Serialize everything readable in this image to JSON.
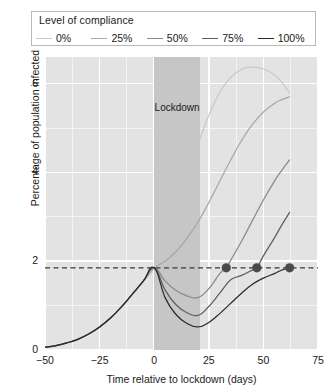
{
  "legend": {
    "title": "Level of compliance",
    "entries": [
      {
        "label": "0%",
        "color": "#c8c8c8"
      },
      {
        "label": "25%",
        "color": "#a8a8a8"
      },
      {
        "label": "50%",
        "color": "#8a8a8a"
      },
      {
        "label": "75%",
        "color": "#5e5e5e"
      },
      {
        "label": "100%",
        "color": "#2b2b2b"
      }
    ]
  },
  "annotations": {
    "lockdown_label": "Lockdown"
  },
  "chart_data": {
    "type": "line",
    "title": "",
    "subtitle": "",
    "xlabel": "Time relative to lockdown (days)",
    "ylabel": "Percentage of population infected",
    "xlim": [
      -50,
      75
    ],
    "ylim": [
      0,
      6.6
    ],
    "xticks": [
      -50,
      -25,
      0,
      25,
      50,
      75
    ],
    "xtick_labels": [
      "−50",
      "−25",
      "0",
      "25",
      "50",
      "75"
    ],
    "yticks": [
      0,
      2,
      4,
      6
    ],
    "ytick_labels": [
      "0",
      "2",
      "4",
      "6"
    ],
    "minor_yticks": [
      1,
      3,
      5
    ],
    "minor_xticks": [
      -37.5,
      -12.5,
      12.5,
      37.5,
      62.5
    ],
    "grid": true,
    "grid_color": "#ffffff",
    "panel_background": "#e3e3e3",
    "legend_position": "above-plot",
    "shaded_regions": [
      {
        "name": "lockdown",
        "x_start": 0,
        "x_end": 21,
        "color": "#c6c6c6",
        "label": "Lockdown",
        "label_y": 5.45
      }
    ],
    "reference_lines": [
      {
        "name": "baseline-prevalence",
        "orientation": "horizontal",
        "y": 1.85,
        "style": "dashed",
        "color": "#3a3a3a"
      }
    ],
    "markers": [
      {
        "name": "return-to-baseline-50",
        "x": 33,
        "y": 1.85,
        "series": "50%",
        "color": "#4a4a4a"
      },
      {
        "name": "return-to-baseline-75",
        "x": 47,
        "y": 1.85,
        "series": "75%",
        "color": "#4a4a4a"
      },
      {
        "name": "return-to-baseline-100",
        "x": 62,
        "y": 1.85,
        "series": "100%",
        "color": "#4a4a4a"
      }
    ],
    "series": [
      {
        "name": "0%",
        "color": "#c8c8c8",
        "points": [
          [
            -50,
            0.06
          ],
          [
            -45,
            0.1
          ],
          [
            -40,
            0.16
          ],
          [
            -35,
            0.24
          ],
          [
            -30,
            0.36
          ],
          [
            -25,
            0.52
          ],
          [
            -20,
            0.72
          ],
          [
            -15,
            0.97
          ],
          [
            -10,
            1.26
          ],
          [
            -5,
            1.55
          ],
          [
            0,
            1.85
          ],
          [
            5,
            2.45
          ],
          [
            10,
            3.15
          ],
          [
            15,
            3.9
          ],
          [
            20,
            4.62
          ],
          [
            25,
            5.28
          ],
          [
            30,
            5.8
          ],
          [
            35,
            6.14
          ],
          [
            40,
            6.32
          ],
          [
            45,
            6.37
          ],
          [
            50,
            6.33
          ],
          [
            55,
            6.2
          ],
          [
            58,
            6.05
          ],
          [
            62,
            5.8
          ]
        ]
      },
      {
        "name": "25%",
        "color": "#a8a8a8",
        "points": [
          [
            -50,
            0.06
          ],
          [
            -45,
            0.1
          ],
          [
            -40,
            0.16
          ],
          [
            -35,
            0.24
          ],
          [
            -30,
            0.36
          ],
          [
            -25,
            0.52
          ],
          [
            -20,
            0.72
          ],
          [
            -15,
            0.97
          ],
          [
            -10,
            1.26
          ],
          [
            -5,
            1.55
          ],
          [
            0,
            1.85
          ],
          [
            5,
            2.0
          ],
          [
            10,
            2.22
          ],
          [
            15,
            2.52
          ],
          [
            20,
            2.88
          ],
          [
            25,
            3.32
          ],
          [
            30,
            3.8
          ],
          [
            35,
            4.28
          ],
          [
            40,
            4.72
          ],
          [
            45,
            5.08
          ],
          [
            50,
            5.36
          ],
          [
            55,
            5.55
          ],
          [
            58,
            5.63
          ],
          [
            62,
            5.7
          ]
        ]
      },
      {
        "name": "50%",
        "color": "#8a8a8a",
        "points": [
          [
            -50,
            0.06
          ],
          [
            -45,
            0.1
          ],
          [
            -40,
            0.16
          ],
          [
            -35,
            0.24
          ],
          [
            -30,
            0.36
          ],
          [
            -25,
            0.52
          ],
          [
            -20,
            0.72
          ],
          [
            -15,
            0.97
          ],
          [
            -10,
            1.26
          ],
          [
            -5,
            1.55
          ],
          [
            0,
            1.85
          ],
          [
            5,
            1.55
          ],
          [
            10,
            1.34
          ],
          [
            15,
            1.22
          ],
          [
            20,
            1.18
          ],
          [
            25,
            1.38
          ],
          [
            30,
            1.72
          ],
          [
            33,
            1.85
          ],
          [
            35,
            2.02
          ],
          [
            40,
            2.45
          ],
          [
            45,
            2.92
          ],
          [
            50,
            3.38
          ],
          [
            55,
            3.8
          ],
          [
            58,
            4.02
          ],
          [
            62,
            4.28
          ]
        ]
      },
      {
        "name": "75%",
        "color": "#5e5e5e",
        "points": [
          [
            -50,
            0.06
          ],
          [
            -45,
            0.1
          ],
          [
            -40,
            0.16
          ],
          [
            -35,
            0.24
          ],
          [
            -30,
            0.36
          ],
          [
            -25,
            0.52
          ],
          [
            -20,
            0.72
          ],
          [
            -15,
            0.97
          ],
          [
            -10,
            1.26
          ],
          [
            -5,
            1.55
          ],
          [
            0,
            1.85
          ],
          [
            5,
            1.35
          ],
          [
            10,
            1.02
          ],
          [
            15,
            0.84
          ],
          [
            20,
            0.78
          ],
          [
            25,
            0.98
          ],
          [
            30,
            1.28
          ],
          [
            35,
            1.58
          ],
          [
            40,
            1.68
          ],
          [
            45,
            1.8
          ],
          [
            47,
            1.85
          ],
          [
            50,
            2.12
          ],
          [
            55,
            2.52
          ],
          [
            58,
            2.78
          ],
          [
            62,
            3.1
          ]
        ]
      },
      {
        "name": "100%",
        "color": "#2b2b2b",
        "points": [
          [
            -50,
            0.06
          ],
          [
            -45,
            0.1
          ],
          [
            -40,
            0.16
          ],
          [
            -35,
            0.24
          ],
          [
            -30,
            0.36
          ],
          [
            -25,
            0.52
          ],
          [
            -20,
            0.72
          ],
          [
            -15,
            0.97
          ],
          [
            -10,
            1.26
          ],
          [
            -5,
            1.55
          ],
          [
            0,
            1.85
          ],
          [
            5,
            1.18
          ],
          [
            10,
            0.8
          ],
          [
            15,
            0.6
          ],
          [
            20,
            0.52
          ],
          [
            25,
            0.62
          ],
          [
            30,
            0.82
          ],
          [
            35,
            1.05
          ],
          [
            40,
            1.28
          ],
          [
            45,
            1.48
          ],
          [
            50,
            1.62
          ],
          [
            55,
            1.72
          ],
          [
            58,
            1.79
          ],
          [
            62,
            1.85
          ]
        ]
      }
    ]
  }
}
